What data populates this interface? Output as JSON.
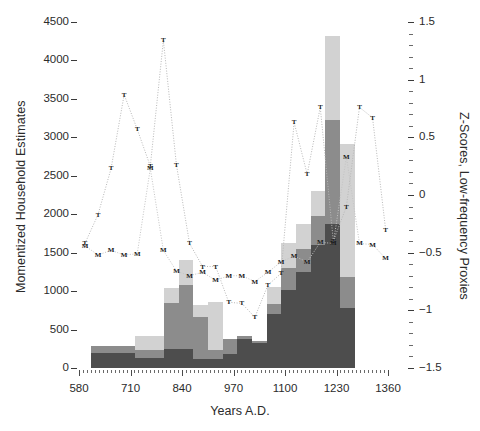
{
  "chart_data": {
    "type": "bar",
    "title": "",
    "xlabel": "Years  A.D.",
    "ylabel": "Momentized Household Estimates",
    "ylabel_right": "Z-Scores, Low-frequency Proxies",
    "xlim": [
      580,
      1360
    ],
    "ylim": [
      0,
      4500
    ],
    "ylim_right": [
      -1.5,
      1.5
    ],
    "grid": false,
    "legend": "none",
    "xticks": [
      580,
      710,
      840,
      970,
      1100,
      1230,
      1360
    ],
    "yticks_left": [
      0,
      500,
      1000,
      1500,
      2000,
      2500,
      3000,
      3500,
      4000,
      4500
    ],
    "yticks_right": [
      -1.5,
      -1,
      -0.5,
      0,
      0.5,
      1,
      1.5
    ],
    "bar_colors": {
      "dark": "#4d4d4d",
      "medium": "#8c8c8c",
      "light": "#d2d2d2"
    },
    "bar_start_x": 610,
    "bar_width_years": 37,
    "bar_left_edges": [
      610,
      647,
      684,
      721,
      758,
      795,
      832,
      869,
      906,
      943,
      980,
      1017,
      1054,
      1091,
      1128,
      1165,
      1202,
      1239
    ],
    "series": [
      {
        "name": "dark-segment",
        "color": "#4d4d4d",
        "values": [
          200,
          200,
          200,
          200,
          130,
          130,
          250,
          250,
          120,
          120,
          180,
          180,
          300,
          700,
          1020,
          1250,
          1600,
          1870,
          780
        ]
      },
      {
        "name": "medium-segment",
        "color": "#8c8c8c",
        "values": [
          80,
          80,
          80,
          80,
          110,
          110,
          600,
          600,
          120,
          120,
          200,
          200,
          100,
          130,
          280,
          300,
          380,
          1350,
          400
        ]
      },
      {
        "name": "light-segment",
        "color": "#d2d2d2",
        "values": [
          0,
          0,
          0,
          0,
          180,
          180,
          190,
          190,
          160,
          160,
          0,
          0,
          340,
          220,
          330,
          320,
          320,
          1100,
          1730
        ]
      }
    ],
    "bars": [
      {
        "x": 610,
        "dark": 200,
        "medium": 80,
        "light": 0
      },
      {
        "x": 647,
        "dark": 200,
        "medium": 80,
        "light": 0
      },
      {
        "x": 684,
        "dark": 200,
        "medium": 80,
        "light": 0
      },
      {
        "x": 721,
        "dark": 130,
        "medium": 110,
        "light": 180
      },
      {
        "x": 758,
        "dark": 130,
        "medium": 110,
        "light": 180
      },
      {
        "x": 795,
        "dark": 250,
        "medium": 600,
        "light": 190
      },
      {
        "x": 832,
        "dark": 250,
        "medium": 830,
        "light": 330
      },
      {
        "x": 869,
        "dark": 120,
        "medium": 540,
        "light": 160
      },
      {
        "x": 906,
        "dark": 120,
        "medium": 120,
        "light": 620
      },
      {
        "x": 943,
        "dark": 180,
        "medium": 200,
        "light": 0
      },
      {
        "x": 980,
        "dark": 380,
        "medium": 40,
        "light": 0
      },
      {
        "x": 1017,
        "dark": 320,
        "medium": 30,
        "light": 0
      },
      {
        "x": 1054,
        "dark": 700,
        "medium": 130,
        "light": 220
      },
      {
        "x": 1091,
        "dark": 1020,
        "medium": 280,
        "light": 330
      },
      {
        "x": 1128,
        "dark": 1250,
        "medium": 300,
        "light": 320
      },
      {
        "x": 1165,
        "dark": 1600,
        "medium": 380,
        "light": 320
      },
      {
        "x": 1202,
        "dark": 1870,
        "medium": 1350,
        "light": 1100
      },
      {
        "x": 1239,
        "dark": 780,
        "medium": 400,
        "light": 1730
      }
    ],
    "proxy_series": [
      {
        "name": "T-proxy",
        "marker": "T",
        "linestyle": "dotted",
        "color": "#b8b8b8",
        "points": [
          {
            "x": 595,
            "z": -0.42
          },
          {
            "x": 628,
            "z": -0.17
          },
          {
            "x": 661,
            "z": 0.23
          },
          {
            "x": 694,
            "z": 0.87
          },
          {
            "x": 727,
            "z": 0.57
          },
          {
            "x": 760,
            "z": 0.25
          },
          {
            "x": 793,
            "z": 1.34
          },
          {
            "x": 826,
            "z": 0.26
          },
          {
            "x": 859,
            "z": -0.42
          },
          {
            "x": 892,
            "z": -0.62
          },
          {
            "x": 925,
            "z": -0.62
          },
          {
            "x": 958,
            "z": -0.93
          },
          {
            "x": 991,
            "z": -0.94
          },
          {
            "x": 1024,
            "z": -1.06
          },
          {
            "x": 1057,
            "z": -0.78
          },
          {
            "x": 1090,
            "z": -0.68
          },
          {
            "x": 1123,
            "z": 0.63
          },
          {
            "x": 1156,
            "z": 0.18
          },
          {
            "x": 1189,
            "z": 0.76
          },
          {
            "x": 1222,
            "z": -0.4
          },
          {
            "x": 1255,
            "z": -0.1
          },
          {
            "x": 1288,
            "z": 0.76
          },
          {
            "x": 1321,
            "z": 0.67
          },
          {
            "x": 1354,
            "z": -0.3
          },
          {
            "x": 1387,
            "z": -0.5
          },
          {
            "x": 1420,
            "z": -0.72
          }
        ]
      },
      {
        "name": "M-proxy",
        "marker": "M",
        "linestyle": "dotted",
        "color": "#c4c4c4",
        "points": [
          {
            "x": 595,
            "z": -0.44
          },
          {
            "x": 628,
            "z": -0.52
          },
          {
            "x": 661,
            "z": -0.48
          },
          {
            "x": 694,
            "z": -0.52
          },
          {
            "x": 727,
            "z": -0.51
          },
          {
            "x": 760,
            "z": 0.23
          },
          {
            "x": 793,
            "z": -0.48
          },
          {
            "x": 826,
            "z": -0.66
          },
          {
            "x": 859,
            "z": -0.7
          },
          {
            "x": 892,
            "z": -0.67
          },
          {
            "x": 925,
            "z": -0.74
          },
          {
            "x": 958,
            "z": -0.7
          },
          {
            "x": 991,
            "z": -0.7
          },
          {
            "x": 1024,
            "z": -0.75
          },
          {
            "x": 1057,
            "z": -0.67
          },
          {
            "x": 1090,
            "z": -0.58
          },
          {
            "x": 1123,
            "z": -0.53
          },
          {
            "x": 1156,
            "z": -0.58
          },
          {
            "x": 1189,
            "z": -0.41
          },
          {
            "x": 1222,
            "z": -0.42
          },
          {
            "x": 1255,
            "z": 0.33
          },
          {
            "x": 1288,
            "z": -0.42
          },
          {
            "x": 1321,
            "z": -0.43
          },
          {
            "x": 1354,
            "z": -0.55
          },
          {
            "x": 1387,
            "z": -0.6
          },
          {
            "x": 1420,
            "z": -0.63
          }
        ]
      }
    ]
  }
}
